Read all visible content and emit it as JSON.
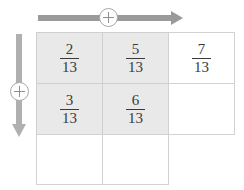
{
  "denominator": "13",
  "colors": {
    "shaded_cell": "#e9e9e9",
    "cell_border": "#d2d2d2",
    "arrow_horizontal": "#9a9a9a",
    "arrow_vertical": "#b0b0b0",
    "text": "#3a3a3a",
    "background": "#ffffff"
  },
  "controls": {
    "horizontal_add": {
      "icon": "plus-circle-icon",
      "symbol": "+",
      "direction": "right"
    },
    "vertical_add": {
      "icon": "plus-circle-icon",
      "symbol": "+",
      "direction": "down"
    }
  },
  "grid": {
    "columns": 3,
    "rows": 3,
    "cells": [
      [
        {
          "numerator": "2",
          "denominator": "13",
          "shaded": true,
          "empty": false
        },
        {
          "numerator": "5",
          "denominator": "13",
          "shaded": true,
          "empty": false
        },
        {
          "numerator": "7",
          "denominator": "13",
          "shaded": false,
          "empty": false
        }
      ],
      [
        {
          "numerator": "3",
          "denominator": "13",
          "shaded": true,
          "empty": false
        },
        {
          "numerator": "6",
          "denominator": "13",
          "shaded": true,
          "empty": false
        },
        {
          "numerator": "",
          "denominator": "",
          "shaded": false,
          "empty": true
        }
      ],
      [
        {
          "numerator": "",
          "denominator": "",
          "shaded": false,
          "empty": true
        },
        {
          "numerator": "",
          "denominator": "",
          "shaded": false,
          "empty": true
        },
        {
          "numerator": "",
          "denominator": "",
          "shaded": false,
          "empty": true,
          "hidden": true
        }
      ]
    ]
  }
}
